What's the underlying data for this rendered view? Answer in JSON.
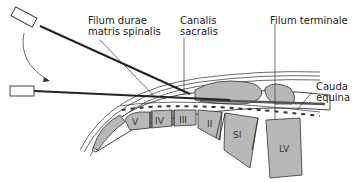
{
  "diagram": {
    "labels": {
      "filum_durae_line1": "Filum durae",
      "filum_durae_line2": "matris spinalis",
      "canalis_line1": "Canalis",
      "canalis_line2": "sacralis",
      "filum_terminale": "Filum terminale",
      "cauda_line1": "Cauda",
      "cauda_line2": "equina"
    },
    "vertebrae": [
      "V",
      "IV",
      "III",
      "II",
      "SI",
      "LV"
    ],
    "colors": {
      "bone": "#b8b8b8",
      "outline": "#333333",
      "needle": "#222222",
      "background": "#ffffff"
    }
  }
}
